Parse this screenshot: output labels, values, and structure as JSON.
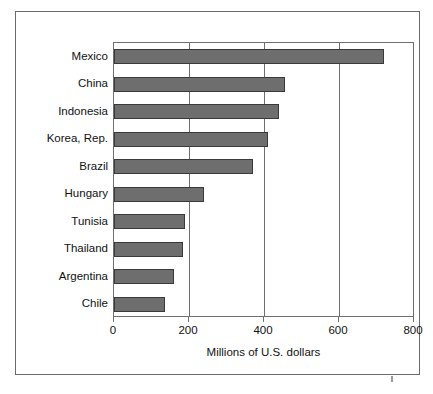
{
  "figure": {
    "frame_color": "#6b6b6b",
    "background": "#ffffff",
    "page_mark": ""
  },
  "chart_data": {
    "type": "bar",
    "orientation": "horizontal",
    "title": "",
    "xlabel": "Millions of U.S. dollars",
    "ylabel": "",
    "categories": [
      "Mexico",
      "China",
      "Indonesia",
      "Korea, Rep.",
      "Brazil",
      "Hungary",
      "Tunisia",
      "Thailand",
      "Argentina",
      "Chile"
    ],
    "values": [
      720,
      455,
      440,
      410,
      370,
      240,
      190,
      185,
      160,
      135
    ],
    "xlim": [
      0,
      800
    ],
    "xticks": [
      0,
      200,
      400,
      600,
      800
    ],
    "xticklabels": [
      "0",
      "200",
      "400",
      "600",
      "800"
    ],
    "grid": "vertical-gridlines-at-xticks",
    "legend": "none",
    "bar_color": "#6e6e6e",
    "bar_edge_color": "#3a3a3a",
    "axis_color": "#6f6f6f"
  }
}
